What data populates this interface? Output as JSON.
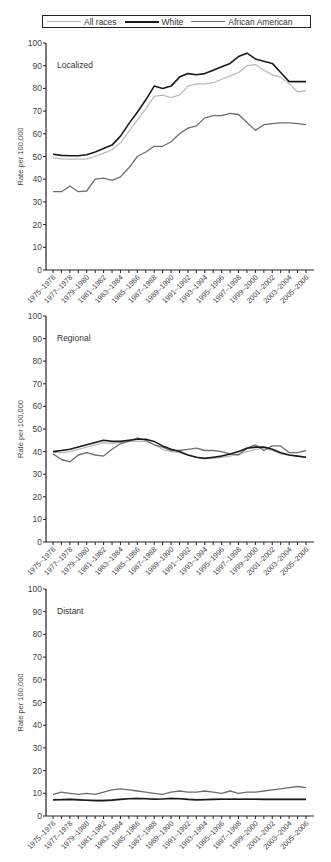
{
  "legend": {
    "items": [
      {
        "label": "All races",
        "color": "#b8b8b8",
        "width": 1.2
      },
      {
        "label": "White",
        "color": "#1a1a1a",
        "width": 1.6
      },
      {
        "label": "African American",
        "color": "#6e6e6e",
        "width": 1.3
      }
    ]
  },
  "chart_data": [
    {
      "type": "line",
      "title": "Localized",
      "xlabel": "",
      "ylabel": "Rate per 100,000",
      "ylim": [
        0,
        100
      ],
      "yticks": [
        0,
        10,
        20,
        30,
        40,
        50,
        60,
        70,
        80,
        90,
        100
      ],
      "grid": false,
      "legend_position": "top",
      "x": [
        "1975–1976",
        "1976–1977",
        "1977–1978",
        "1978–1979",
        "1979–1980",
        "1980–1981",
        "1981–1982",
        "1982–1983",
        "1983–1984",
        "1984–1985",
        "1985–1986",
        "1986–1987",
        "1987–1988",
        "1988–1989",
        "1989–1990",
        "1990–1991",
        "1991–1992",
        "1992–1993",
        "1993–1994",
        "1994–1995",
        "1995–1996",
        "1996–1997",
        "1997–1998",
        "1998–1999",
        "1999–2000",
        "2000–2001",
        "2001–2002",
        "2002–2003",
        "2003–2004",
        "2004–2005",
        "2005–2006"
      ],
      "xtick_labels": [
        "1975–1976",
        "1977–1978",
        "1979–1980",
        "1981–1982",
        "1983–1984",
        "1985–1986",
        "1987–1988",
        "1989–1990",
        "1991–1992",
        "1993–1994",
        "1995–1996",
        "1997–1998",
        "1999–2000",
        "2001–2002",
        "2003–2004",
        "2005–2006"
      ],
      "series": [
        {
          "name": "All races",
          "values": [
            49.5,
            49,
            48.8,
            48.8,
            49,
            50,
            51.5,
            53,
            56,
            61,
            66,
            71,
            76.5,
            77,
            76,
            77,
            81,
            82,
            82,
            82.5,
            84,
            85.5,
            87,
            90,
            90.5,
            88,
            86,
            85,
            82,
            78.5,
            79,
            79,
            78.8
          ]
        },
        {
          "name": "White",
          "values": [
            51,
            50.5,
            50.3,
            50.3,
            50.8,
            52,
            53.5,
            55,
            59,
            64.5,
            69.5,
            75,
            81,
            80,
            81,
            85,
            86.5,
            86,
            86.5,
            88,
            89.5,
            91,
            94,
            95.5,
            93,
            92,
            91,
            87,
            83,
            83,
            83
          ]
        },
        {
          "name": "African American",
          "values": [
            34.5,
            34.5,
            37,
            34.5,
            34.8,
            40,
            40.5,
            39.5,
            41,
            45,
            50,
            52,
            54.5,
            54.5,
            56.5,
            60,
            62.5,
            63.5,
            67,
            68,
            68,
            69,
            68.5,
            65,
            61.5,
            64,
            64.5,
            64.8,
            64.8,
            64.5,
            64
          ]
        }
      ]
    },
    {
      "type": "line",
      "title": "Regional",
      "xlabel": "",
      "ylabel": "Rate per 100,000",
      "ylim": [
        0,
        100
      ],
      "yticks": [
        0,
        10,
        20,
        30,
        40,
        50,
        60,
        70,
        80,
        90,
        100
      ],
      "grid": false,
      "x": [
        "1975–1976",
        "1976–1977",
        "1977–1978",
        "1978–1979",
        "1979–1980",
        "1980–1981",
        "1981–1982",
        "1982–1983",
        "1983–1984",
        "1984–1985",
        "1985–1986",
        "1986–1987",
        "1987–1988",
        "1988–1989",
        "1989–1990",
        "1990–1991",
        "1991–1992",
        "1992–1993",
        "1993–1994",
        "1994–1995",
        "1995–1996",
        "1996–1997",
        "1997–1998",
        "1998–1999",
        "1999–2000",
        "2000–2001",
        "2001–2002",
        "2002–2003",
        "2003–2004",
        "2004–2005",
        "2005–2006"
      ],
      "xtick_labels": [
        "1975–1976",
        "1977–1978",
        "1979–1980",
        "1981–1982",
        "1983–1984",
        "1985–1986",
        "1987–1988",
        "1989–1990",
        "1991–1992",
        "1993–1994",
        "1995–1996",
        "1997–1998",
        "1999–2000",
        "2001–2002",
        "2003–2004",
        "2005–2006"
      ],
      "series": [
        {
          "name": "All races",
          "values": [
            39.5,
            39.5,
            40,
            41,
            42,
            43,
            44,
            43.5,
            44,
            44.5,
            44.5,
            44.5,
            43,
            41,
            40,
            39.5,
            38.5,
            37.5,
            37,
            37,
            37.5,
            38,
            39,
            40,
            41,
            41.5,
            40.5,
            39,
            38.5,
            38,
            37.5
          ]
        },
        {
          "name": "White",
          "values": [
            40,
            40.5,
            41,
            42,
            43,
            44,
            45,
            44.5,
            44.5,
            45,
            45.5,
            45.5,
            44.5,
            42.5,
            41,
            40,
            38.5,
            37.5,
            37,
            37.5,
            38,
            39,
            40,
            41.5,
            42,
            42,
            41,
            39.5,
            38.5,
            38,
            37.5
          ]
        },
        {
          "name": "African American",
          "values": [
            39,
            36.5,
            35.5,
            38.5,
            39.5,
            38.5,
            38,
            41,
            43.5,
            44.5,
            46,
            45,
            43,
            42,
            40.5,
            40.5,
            41,
            41.5,
            40.5,
            40.5,
            40,
            39,
            38.5,
            41.5,
            43,
            40.5,
            42.5,
            42.5,
            39.5,
            39.5,
            40.5
          ]
        }
      ]
    },
    {
      "type": "line",
      "title": "Distant",
      "xlabel": "",
      "ylabel": "Rate per 100,000",
      "ylim": [
        0,
        100
      ],
      "yticks": [
        0,
        10,
        20,
        30,
        40,
        50,
        60,
        70,
        80,
        90,
        100
      ],
      "grid": false,
      "x": [
        "1975–1976",
        "1976–1977",
        "1977–1978",
        "1978–1979",
        "1979–1980",
        "1980–1981",
        "1981–1982",
        "1982–1983",
        "1983–1984",
        "1984–1985",
        "1985–1986",
        "1986–1987",
        "1987–1988",
        "1988–1989",
        "1989–1990",
        "1990–1991",
        "1991–1992",
        "1992–1993",
        "1993–1994",
        "1994–1995",
        "1995–1996",
        "1996–1997",
        "1997–1998",
        "1998–1999",
        "1999–2000",
        "2000–2001",
        "2001–2002",
        "2002–2003",
        "2003–2004",
        "2004–2005",
        "2005–2006"
      ],
      "xtick_labels": [
        "1975–1976",
        "1977–1978",
        "1979–1980",
        "1981–1982",
        "1983–1984",
        "1985–1986",
        "1987–1988",
        "1989–1990",
        "1991–1992",
        "1993–1994",
        "1995–1996",
        "1997–1998",
        "1999–2000",
        "2001–2002",
        "2003–2004",
        "2005–2006"
      ],
      "series": [
        {
          "name": "All races",
          "values": [
            7.3,
            7.4,
            7.5,
            7.3,
            7.1,
            7,
            7,
            7.2,
            7.5,
            7.8,
            7.9,
            7.8,
            7.6,
            7.7,
            7.9,
            7.8,
            7.5,
            7.3,
            7.4,
            7.5,
            7.6,
            7.6,
            7.6,
            7.6,
            7.6,
            7.5,
            7.5,
            7.5,
            7.5,
            7.5,
            7.5
          ]
        },
        {
          "name": "White",
          "values": [
            7.1,
            7.2,
            7.3,
            7.1,
            6.9,
            6.8,
            6.8,
            7,
            7.3,
            7.6,
            7.7,
            7.6,
            7.4,
            7.5,
            7.7,
            7.6,
            7.3,
            7.1,
            7.2,
            7.3,
            7.4,
            7.4,
            7.4,
            7.4,
            7.4,
            7.3,
            7.3,
            7.3,
            7.3,
            7.3,
            7.3
          ]
        },
        {
          "name": "African American",
          "values": [
            9.5,
            10.5,
            10,
            9.5,
            10,
            9.5,
            10.5,
            11.5,
            12,
            11.5,
            11,
            10.5,
            10,
            9.5,
            10.5,
            11,
            10.5,
            10.5,
            11,
            10.5,
            10,
            11,
            10,
            10.5,
            10.5,
            11,
            11.5,
            12,
            12.5,
            13,
            12.5
          ]
        }
      ]
    }
  ]
}
